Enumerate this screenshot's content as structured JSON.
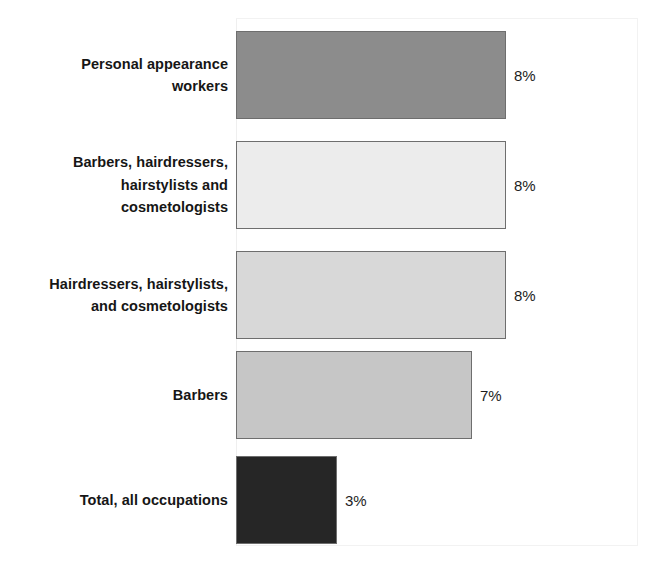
{
  "chart_data": {
    "type": "bar",
    "orientation": "horizontal",
    "title": "",
    "xlabel": "",
    "ylabel": "",
    "categories": [
      "Personal appearance workers",
      "Barbers, hairdressers, hairstylists and cosmetologists",
      "Hairdressers, hairstylists, and cosmetologists",
      "Barbers",
      "Total, all occupations"
    ],
    "values": [
      8,
      8,
      8,
      7,
      3
    ],
    "value_labels": [
      "8%",
      "8%",
      "8%",
      "7%",
      "3%"
    ],
    "unit": "%",
    "xlim": [
      0,
      10
    ],
    "grid": false,
    "legend": false,
    "bar_colors": [
      "#8c8c8c",
      "#ececec",
      "#d8d8d8",
      "#c6c6c6",
      "#262626"
    ],
    "bar_border_color": "#6e6e6e"
  },
  "bars": [
    {
      "label_lines": [
        "Personal appearance",
        "workers"
      ],
      "value_label": "8%",
      "fill": "#8c8c8c",
      "top": 31,
      "height": 88,
      "width": 270
    },
    {
      "label_lines": [
        "Barbers, hairdressers,",
        "hairstylists and",
        "cosmetologists"
      ],
      "value_label": "8%",
      "fill": "#ececec",
      "top": 141,
      "height": 88,
      "width": 270
    },
    {
      "label_lines": [
        "Hairdressers, hairstylists,",
        "and cosmetologists"
      ],
      "value_label": "8%",
      "fill": "#d8d8d8",
      "top": 251,
      "height": 88,
      "width": 270
    },
    {
      "label_lines": [
        "Barbers"
      ],
      "value_label": "7%",
      "fill": "#c6c6c6",
      "top": 351,
      "height": 88,
      "width": 236
    },
    {
      "label_lines": [
        "Total, all occupations"
      ],
      "value_label": "3%",
      "fill": "#262626",
      "top": 456,
      "height": 88,
      "width": 101
    }
  ]
}
